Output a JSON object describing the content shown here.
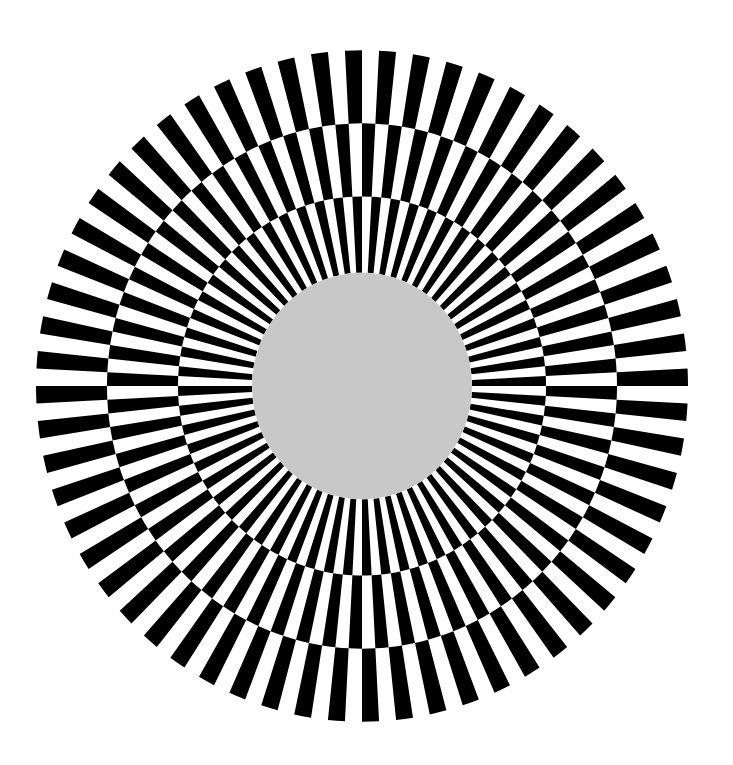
{
  "figure": {
    "type": "radial-checkerboard-pattern",
    "center": [
      362,
      386
    ],
    "scale_y": 1.03,
    "colors": {
      "background": "#ffffff",
      "dark": "#000000",
      "light": "#ffffff",
      "center_disc": "#c8c8c8"
    },
    "wedge_pairs": 60,
    "center_disc_radius": 110,
    "rings": [
      {
        "name": "inner-ring",
        "r_inner": 110,
        "r_outer": 184,
        "phase_deg": -1.5
      },
      {
        "name": "middle-ring",
        "r_inner": 184,
        "r_outer": 255,
        "phase_deg": 1.5
      },
      {
        "name": "outer-ring",
        "r_inner": 255,
        "r_outer": 326,
        "phase_deg": -1.5
      }
    ]
  }
}
